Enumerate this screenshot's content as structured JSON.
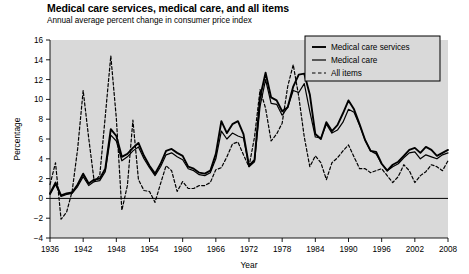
{
  "chart_data": {
    "type": "line",
    "title": "Medical care services, medical care, and all items",
    "subtitle": "Annual average percent change in consumer price index",
    "xlabel": "Year",
    "ylabel": "Percentage",
    "xlim": [
      1936,
      2008
    ],
    "ylim": [
      -4,
      16
    ],
    "ytick_step": 2,
    "xtick_step": 6,
    "xticks": [
      1936,
      1942,
      1948,
      1954,
      1960,
      1966,
      1972,
      1978,
      1984,
      1990,
      1996,
      2002,
      2008
    ],
    "yticks": [
      -4,
      -2,
      0,
      2,
      4,
      6,
      8,
      10,
      12,
      14,
      16
    ],
    "grid": false,
    "plot_background": "#d9d9d9",
    "zero_line": 0,
    "legend_position": "top-right",
    "x": [
      1936,
      1937,
      1938,
      1939,
      1940,
      1941,
      1942,
      1943,
      1944,
      1945,
      1946,
      1947,
      1948,
      1949,
      1950,
      1951,
      1952,
      1953,
      1954,
      1955,
      1956,
      1957,
      1958,
      1959,
      1960,
      1961,
      1962,
      1963,
      1964,
      1965,
      1966,
      1967,
      1968,
      1969,
      1970,
      1971,
      1972,
      1973,
      1974,
      1975,
      1976,
      1977,
      1978,
      1979,
      1980,
      1981,
      1982,
      1983,
      1984,
      1985,
      1986,
      1987,
      1988,
      1989,
      1990,
      1991,
      1992,
      1993,
      1994,
      1995,
      1996,
      1997,
      1998,
      1999,
      2000,
      2001,
      2002,
      2003,
      2004,
      2005,
      2006,
      2007,
      2008
    ],
    "series": [
      {
        "name": "Medical care services",
        "color": "#000000",
        "linestyle": "solid",
        "linewidth": 1.9,
        "values": [
          0.5,
          1.6,
          0.3,
          0.5,
          0.6,
          1.4,
          2.5,
          1.5,
          1.9,
          2.0,
          3.0,
          7.0,
          6.3,
          4.2,
          4.5,
          5.1,
          5.6,
          4.3,
          3.3,
          2.5,
          3.5,
          4.8,
          5.0,
          4.6,
          4.3,
          3.2,
          3.0,
          2.6,
          2.5,
          2.8,
          4.5,
          7.8,
          6.6,
          7.5,
          7.8,
          6.5,
          3.3,
          3.9,
          10.2,
          12.7,
          10.2,
          9.9,
          8.8,
          9.2,
          11.3,
          12.5,
          12.6,
          10.5,
          6.5,
          6.0,
          7.7,
          6.8,
          7.4,
          8.6,
          9.9,
          9.0,
          7.5,
          5.9,
          4.8,
          4.7,
          3.5,
          2.8,
          3.4,
          3.7,
          4.3,
          4.9,
          5.1,
          4.6,
          5.2,
          4.9,
          4.3,
          4.6,
          4.9
        ]
      },
      {
        "name": "Medical care",
        "color": "#000000",
        "linestyle": "solid",
        "linewidth": 1.2,
        "values": [
          0.4,
          1.4,
          0.2,
          0.4,
          0.5,
          1.2,
          2.2,
          1.3,
          1.7,
          1.8,
          2.7,
          6.4,
          5.8,
          3.8,
          4.2,
          4.8,
          5.2,
          4.0,
          3.1,
          2.3,
          3.2,
          4.4,
          4.6,
          4.2,
          3.9,
          3.0,
          2.8,
          2.4,
          2.3,
          2.6,
          4.0,
          6.8,
          6.0,
          6.6,
          6.3,
          6.1,
          3.2,
          3.7,
          9.3,
          12.0,
          9.6,
          9.5,
          8.4,
          9.2,
          10.9,
          10.7,
          11.6,
          8.8,
          6.2,
          6.1,
          7.5,
          6.6,
          6.9,
          7.7,
          9.0,
          8.7,
          7.4,
          5.9,
          4.8,
          4.5,
          3.5,
          2.8,
          3.2,
          3.5,
          4.1,
          4.6,
          4.7,
          4.0,
          4.4,
          4.2,
          4.0,
          4.4,
          4.6
        ]
      },
      {
        "name": "All items",
        "color": "#000000",
        "linestyle": "dashed",
        "linewidth": 1.2,
        "values": [
          1.4,
          3.6,
          -2.1,
          -1.4,
          0.7,
          5.0,
          10.9,
          6.1,
          1.7,
          2.3,
          8.3,
          14.4,
          8.1,
          -1.2,
          1.3,
          7.9,
          1.9,
          0.8,
          0.7,
          -0.4,
          1.5,
          3.3,
          2.8,
          0.7,
          1.7,
          1.0,
          1.0,
          1.3,
          1.3,
          1.6,
          2.9,
          3.1,
          4.2,
          5.5,
          5.7,
          4.4,
          3.2,
          6.2,
          11.0,
          9.1,
          5.8,
          6.5,
          7.6,
          11.3,
          13.5,
          10.3,
          6.2,
          3.2,
          4.3,
          3.6,
          1.9,
          3.6,
          4.1,
          4.8,
          5.4,
          4.2,
          3.0,
          3.0,
          2.6,
          2.8,
          3.0,
          2.3,
          1.6,
          2.2,
          3.4,
          2.8,
          1.6,
          2.3,
          2.7,
          3.4,
          3.2,
          2.8,
          3.8
        ]
      }
    ]
  },
  "legend": {
    "items": [
      {
        "label": "Medical care services"
      },
      {
        "label": "Medical care"
      },
      {
        "label": "All items"
      }
    ]
  }
}
